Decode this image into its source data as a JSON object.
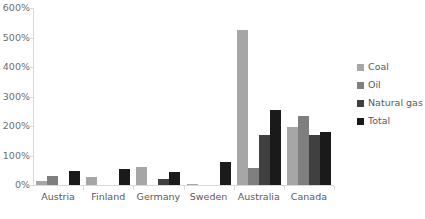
{
  "chart_data": {
    "type": "bar",
    "title": "",
    "subtitle": "",
    "xlabel": "",
    "ylabel": "",
    "ylim": [
      0,
      600
    ],
    "y_tick_labels": [
      "0%",
      "100%",
      "200%",
      "300%",
      "400%",
      "500%",
      "600%"
    ],
    "y_tick_values": [
      0,
      100,
      200,
      300,
      400,
      500,
      600
    ],
    "grid": false,
    "legend_position": "right",
    "categories": [
      "Austria",
      "Finland",
      "Germany",
      "Sweden",
      "Australia",
      "Canada"
    ],
    "series": [
      {
        "name": "Coal",
        "color": "#a6a6a6",
        "values": [
          12,
          28,
          62,
          3,
          525,
          195
        ]
      },
      {
        "name": "Oil",
        "color": "#7f7f7f",
        "values": [
          30,
          0,
          0,
          0,
          58,
          235
        ]
      },
      {
        "name": "Natural gas",
        "color": "#404040",
        "values": [
          0,
          0,
          22,
          0,
          168,
          170
        ]
      },
      {
        "name": "Total",
        "color": "#1a1a1a",
        "values": [
          46,
          55,
          45,
          78,
          255,
          180
        ]
      }
    ]
  },
  "legend": {
    "items": [
      {
        "label": "Coal"
      },
      {
        "label": "Oil"
      },
      {
        "label": "Natural gas"
      },
      {
        "label": "Total"
      }
    ]
  },
  "colors": {
    "axis": "#d9d9d9",
    "text": "#5a5a5a",
    "background": "#ffffff"
  }
}
